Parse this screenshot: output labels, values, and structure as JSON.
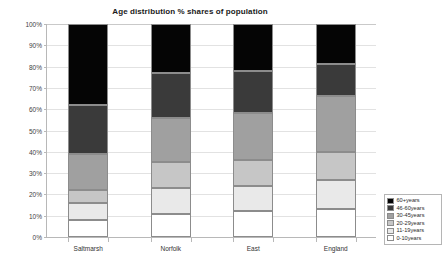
{
  "chart_data": {
    "type": "bar",
    "subtype": "stacked-100-percent",
    "title": "Age distribution % shares of population",
    "xlabel": "",
    "ylabel": "",
    "ylim": [
      0,
      100
    ],
    "ytick_labels": [
      "100%",
      "90%",
      "80%",
      "70%",
      "60%",
      "50%",
      "40%",
      "30%",
      "20%",
      "10%",
      "0%"
    ],
    "ytick_values": [
      100,
      90,
      80,
      70,
      60,
      50,
      40,
      30,
      20,
      10,
      0
    ],
    "grid": true,
    "legend_position": "right-bottom",
    "categories": [
      "Saltmarsh",
      "Norfolk",
      "East",
      "England"
    ],
    "series": [
      {
        "name": "0-10years",
        "color": "#ffffff",
        "values": [
          8,
          11,
          12,
          13
        ]
      },
      {
        "name": "11-19years",
        "color": "#e9e9e9",
        "values": [
          8,
          12,
          12,
          14
        ]
      },
      {
        "name": "20-29years",
        "color": "#c6c6c6",
        "values": [
          6,
          12,
          12,
          13
        ]
      },
      {
        "name": "30-45years",
        "color": "#a0a0a0",
        "values": [
          17,
          21,
          22,
          26
        ]
      },
      {
        "name": "46-60years",
        "color": "#3a3a3a",
        "values": [
          23,
          21,
          20,
          15
        ]
      },
      {
        "name": "60+years",
        "color": "#050505",
        "values": [
          38,
          23,
          22,
          19
        ]
      }
    ],
    "stack_order_bottom_to_top": [
      "0-10years",
      "11-19years",
      "20-29years",
      "30-45years",
      "46-60years",
      "60+years"
    ],
    "cumulative_tops": {
      "Saltmarsh": [
        8,
        16,
        22,
        39,
        62,
        100
      ],
      "Norfolk": [
        11,
        23,
        35,
        56,
        77,
        100
      ],
      "East": [
        12,
        24,
        36,
        58,
        78,
        100
      ],
      "England": [
        13,
        27,
        40,
        66,
        81,
        100
      ]
    }
  },
  "legend": {
    "entries": [
      {
        "label": "60+years",
        "color": "#050505"
      },
      {
        "label": "46-60years",
        "color": "#3a3a3a"
      },
      {
        "label": "30-45years",
        "color": "#a0a0a0"
      },
      {
        "label": "20-29years",
        "color": "#c6c6c6"
      },
      {
        "label": "11-19years",
        "color": "#e9e9e9"
      },
      {
        "label": "0-10years",
        "color": "#ffffff"
      }
    ]
  }
}
